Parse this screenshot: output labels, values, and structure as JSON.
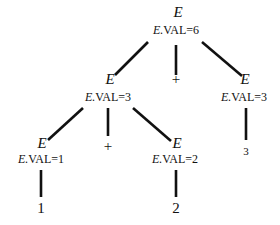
{
  "diagram": {
    "type": "annotated-parse-tree",
    "nodes": [
      {
        "id": "root",
        "symbol": "E",
        "attr_prefix": "E.",
        "attr": "VAL=6",
        "x": 178,
        "y_sym": 12,
        "y_attr": 30
      },
      {
        "id": "e_left",
        "symbol": "E",
        "attr_prefix": "E.",
        "attr": "VAL=3",
        "x": 110,
        "y_sym": 80,
        "y_attr": 97
      },
      {
        "id": "plus_top",
        "symbol": "+",
        "x": 176,
        "y_sym": 80
      },
      {
        "id": "e_right",
        "symbol": "E",
        "attr_prefix": "E.",
        "attr": "VAL=3",
        "x": 245,
        "y_sym": 80,
        "y_attr": 97
      },
      {
        "id": "e_ll",
        "symbol": "E",
        "attr_prefix": "E.",
        "attr": "VAL=1",
        "x": 40,
        "y_sym": 143,
        "y_attr": 160
      },
      {
        "id": "plus_mid",
        "symbol": "+",
        "x": 108,
        "y_sym": 143
      },
      {
        "id": "e_lr",
        "symbol": "E",
        "attr_prefix": "E.",
        "attr": "VAL=2",
        "x": 176,
        "y_sym": 143,
        "y_attr": 160
      },
      {
        "id": "leaf_3",
        "symbol": "3",
        "x": 245,
        "y_sym": 150
      },
      {
        "id": "leaf_1",
        "symbol": "1",
        "x": 40,
        "y_sym": 205
      },
      {
        "id": "leaf_2",
        "symbol": "2",
        "x": 176,
        "y_sym": 205
      }
    ],
    "edges": [
      {
        "from": "root",
        "to": "e_left",
        "x1": 148,
        "y1": 42,
        "x2": 115,
        "y2": 75
      },
      {
        "from": "root",
        "to": "plus_top",
        "x1": 176,
        "y1": 45,
        "x2": 176,
        "y2": 75
      },
      {
        "from": "root",
        "to": "e_right",
        "x1": 202,
        "y1": 42,
        "x2": 242,
        "y2": 76
      },
      {
        "from": "e_left",
        "to": "e_ll",
        "x1": 83,
        "y1": 108,
        "x2": 48,
        "y2": 140
      },
      {
        "from": "e_left",
        "to": "plus_mid",
        "x1": 108,
        "y1": 108,
        "x2": 108,
        "y2": 136
      },
      {
        "from": "e_left",
        "to": "e_lr",
        "x1": 133,
        "y1": 108,
        "x2": 171,
        "y2": 141
      },
      {
        "from": "e_right",
        "to": "leaf_3",
        "x1": 246,
        "y1": 108,
        "x2": 246,
        "y2": 140
      },
      {
        "from": "e_ll",
        "to": "leaf_1",
        "x1": 41,
        "y1": 170,
        "x2": 41,
        "y2": 197
      },
      {
        "from": "e_lr",
        "to": "leaf_2",
        "x1": 176,
        "y1": 170,
        "x2": 176,
        "y2": 197
      }
    ],
    "stroke_color": "#111111"
  }
}
